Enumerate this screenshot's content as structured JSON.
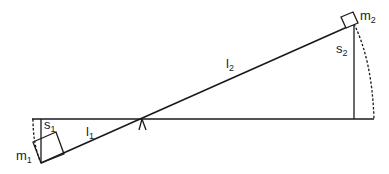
{
  "diagram": {
    "type": "lever",
    "labels": {
      "m1": {
        "base": "m",
        "sub": "1"
      },
      "m2": {
        "base": "m",
        "sub": "2"
      },
      "l1": {
        "base": "l",
        "sub": "1"
      },
      "l2": {
        "base": "l",
        "sub": "2"
      },
      "s1": {
        "base": "s",
        "sub": "1"
      },
      "s2": {
        "base": "s",
        "sub": "2"
      }
    },
    "colors": {
      "line": "#1a1a1a",
      "background": "#ffffff"
    }
  }
}
